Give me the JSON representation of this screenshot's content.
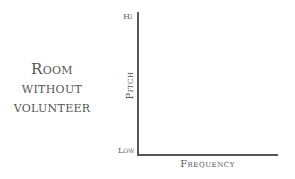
{
  "condition": {
    "lines": [
      "Room",
      "without",
      "volunteer"
    ]
  },
  "chart_data": {
    "type": "line",
    "title": "",
    "xlabel": "Frequency",
    "ylabel": "Pitch",
    "y_tick_labels": [
      "Low",
      "Hi"
    ],
    "x_tick_labels": [],
    "series": [],
    "grid": false,
    "legend": null,
    "annotation": "Room without volunteer"
  }
}
